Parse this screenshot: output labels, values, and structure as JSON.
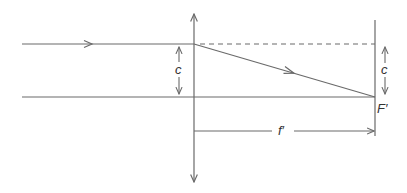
{
  "diagram": {
    "colors": {
      "line": "#6a6a6a",
      "text": "#333333",
      "background": "#ffffff"
    },
    "labels": {
      "c_left": "c",
      "c_right": "c",
      "focal_point": "F′",
      "focal_length": "f′"
    },
    "elements": {
      "lens": "thin converging lens (vertical line with arrowheads at both ends)",
      "incident_ray": "ray parallel to optical axis at height c",
      "refracted_ray": "ray from lens to focal point F′",
      "dashed_extension": "dashed continuation of incident ray height",
      "optical_axis": "horizontal axis",
      "focal_plane": "vertical line through F′",
      "dimension_f": "focal length f′ from lens to F′"
    }
  }
}
